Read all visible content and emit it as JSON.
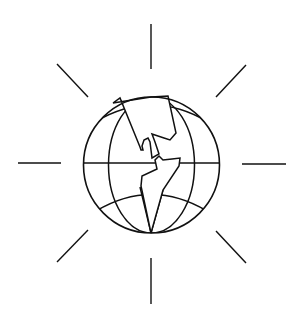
{
  "image": {
    "description": "Line-art globe icon showing the Americas with sun-like rays",
    "width": 303,
    "height": 320,
    "colors": {
      "background": "#ffffff",
      "stroke": "#111111"
    },
    "icon": "globe-americas-rays-icon"
  },
  "globe": {
    "cx": 151.5,
    "cy": 165,
    "r": 68
  },
  "rays": [
    {
      "name": "top",
      "x1": 151,
      "y1": 24,
      "x2": 151,
      "y2": 69
    },
    {
      "name": "bottom",
      "x1": 151,
      "y1": 258,
      "x2": 151,
      "y2": 304
    },
    {
      "name": "left",
      "x1": 18,
      "y1": 163,
      "x2": 61,
      "y2": 163
    },
    {
      "name": "right",
      "x1": 242,
      "y1": 164,
      "x2": 286,
      "y2": 164
    },
    {
      "name": "top-left",
      "x1": 57,
      "y1": 64,
      "x2": 88,
      "y2": 97
    },
    {
      "name": "top-right",
      "x1": 246,
      "y1": 65,
      "x2": 216,
      "y2": 97
    },
    {
      "name": "bottom-left",
      "x1": 88,
      "y1": 230,
      "x2": 57,
      "y2": 262
    },
    {
      "name": "bottom-right",
      "x1": 216,
      "y1": 231,
      "x2": 246,
      "y2": 263
    }
  ]
}
